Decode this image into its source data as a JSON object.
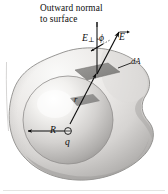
{
  "figure": {
    "kind": "physics-diagram",
    "background_color": "#ffffff",
    "labels": {
      "caption_line1": "Outward normal",
      "caption_line2": "to surface",
      "e_perp": "E",
      "e_perp_subscript": "⊥",
      "phi": "ϕ",
      "e_field": "E",
      "area_element": "dA",
      "radius": "R",
      "charge": "q",
      "distance": "r"
    },
    "colors": {
      "ink": "#0d0d0d",
      "surface_light": "#f0efed",
      "surface_mid": "#d2d1cf",
      "surface_shadow": "#a9a8a6",
      "sphere_highlight": "#fbfbfa",
      "sphere_mid": "#cfcecc",
      "sphere_shadow": "#9c9b99",
      "patch_dark": "#8a8987",
      "border_line": "#b8b7b5"
    },
    "elements": [
      {
        "name": "gaussian-surface",
        "type": "closed-irregular-surface"
      },
      {
        "name": "charged-sphere",
        "type": "sphere",
        "radius_label": "R"
      },
      {
        "name": "point-charge",
        "type": "charge-marker",
        "label": "q"
      },
      {
        "name": "area-element-patch",
        "type": "parallelogram",
        "label": "dA"
      },
      {
        "name": "outward-normal-line",
        "type": "line"
      },
      {
        "name": "electric-field-vector",
        "type": "vector",
        "label": "E"
      },
      {
        "name": "perpendicular-component-vector",
        "type": "vector",
        "label": "E⊥"
      },
      {
        "name": "angle-arc-phi",
        "type": "arc",
        "label": "ϕ"
      },
      {
        "name": "radial-distance-vector",
        "type": "vector",
        "label": "r"
      }
    ]
  }
}
